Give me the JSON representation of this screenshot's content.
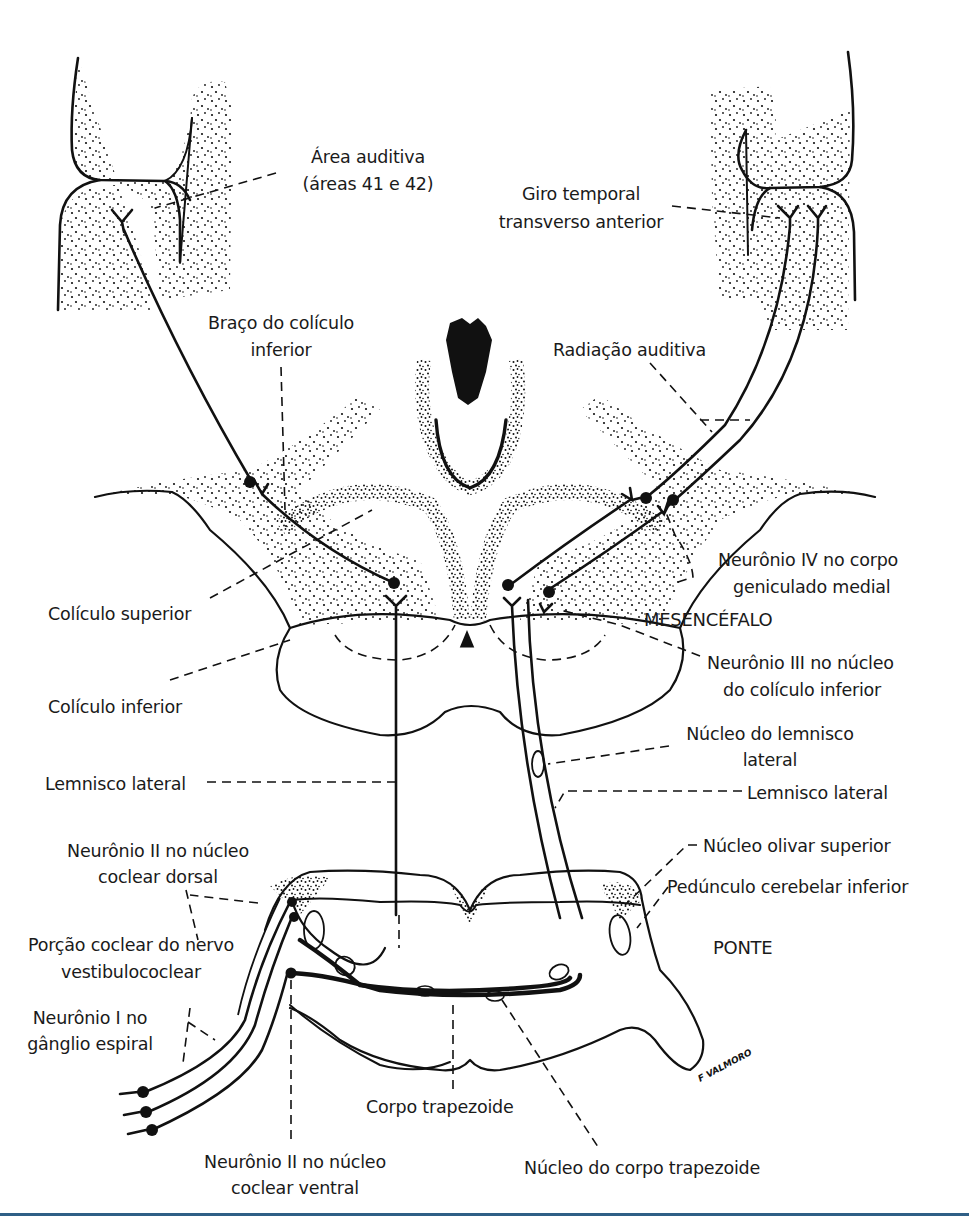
{
  "figure": {
    "signature": "F VALMORO",
    "rule_color": "#2f5f86",
    "ink_color": "#111111",
    "regions": {
      "mesencephalon": "MESENCÉFALO",
      "pons": "PONTE"
    },
    "labels": {
      "auditory_area_1": "Área auditiva",
      "auditory_area_2": "(áreas 41 e 42)",
      "transverse_gyrus_1": "Giro temporal",
      "transverse_gyrus_2": "transverso anterior",
      "brachium_1": "Braço do colículo",
      "brachium_2": "inferior",
      "auditory_radiation": "Radiação auditiva",
      "neuron_iv_1": "Neurônio IV no corpo",
      "neuron_iv_2": "geniculado medial",
      "superior_colliculus": "Colículo superior",
      "inferior_colliculus": "Colículo inferior",
      "neuron_iii_1": "Neurônio III no núcleo",
      "neuron_iii_2": "do colículo inferior",
      "lateral_lemniscus_left": "Lemnisco lateral",
      "nucleus_lateral_lemniscus_1": "Núcleo do lemnisco",
      "nucleus_lateral_lemniscus_2": "lateral",
      "lateral_lemniscus_right": "Lemnisco lateral",
      "neuron_ii_dorsal_1": "Neurônio II no núcleo",
      "neuron_ii_dorsal_2": "coclear dorsal",
      "superior_olivary": "Núcleo olivar superior",
      "inferior_cerebellar_peduncle": "Pedúnculo cerebelar inferior",
      "cochlear_nerve_1": "Porção coclear do nervo",
      "cochlear_nerve_2": "vestibulococlear",
      "neuron_i_1": "Neurônio I no",
      "neuron_i_2": "gânglio espiral",
      "trapezoid_body": "Corpo trapezoide",
      "neuron_ii_ventral_1": "Neurônio II no núcleo",
      "neuron_ii_ventral_2": "coclear ventral",
      "trapezoid_nucleus": "Núcleo do corpo trapezoide"
    }
  }
}
